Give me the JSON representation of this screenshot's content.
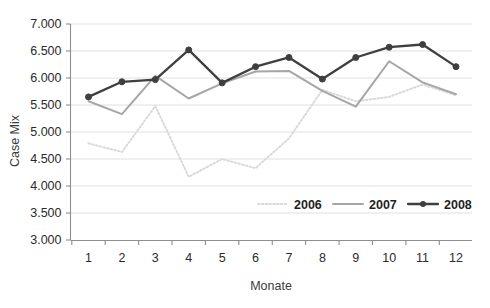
{
  "chart_data": {
    "type": "line",
    "title": "",
    "xlabel": "Monate",
    "ylabel": "Case Mix",
    "categories": [
      "1",
      "2",
      "3",
      "4",
      "5",
      "6",
      "7",
      "8",
      "9",
      "10",
      "11",
      "12"
    ],
    "ylim": [
      3.0,
      7.0
    ],
    "ytick_labels": [
      "3.000",
      "3.500",
      "4.000",
      "4.500",
      "5.000",
      "5.500",
      "6.000",
      "6.500",
      "7.000"
    ],
    "ytick_values": [
      3.0,
      3.5,
      4.0,
      4.5,
      5.0,
      5.5,
      6.0,
      6.5,
      7.0
    ],
    "grid": true,
    "legend_position": "inside-bottom-right",
    "series": [
      {
        "name": "2006",
        "color": "#d9d9d9",
        "style": "dotted",
        "markers": false,
        "values": [
          4.79,
          4.63,
          5.48,
          4.17,
          4.5,
          4.33,
          4.88,
          5.78,
          5.57,
          5.65,
          5.88,
          5.68
        ]
      },
      {
        "name": "2007",
        "color": "#a6a6a6",
        "style": "solid",
        "markers": false,
        "values": [
          5.57,
          5.33,
          6.04,
          5.62,
          5.9,
          6.12,
          6.13,
          5.76,
          5.47,
          6.31,
          5.92,
          5.7
        ]
      },
      {
        "name": "2008",
        "color": "#3f3f3f",
        "style": "solid",
        "markers": true,
        "values": [
          5.65,
          5.93,
          5.97,
          6.52,
          5.91,
          6.21,
          6.38,
          5.98,
          6.38,
          6.57,
          6.62,
          6.21
        ]
      }
    ]
  },
  "legend": {
    "items": [
      {
        "label": "2006"
      },
      {
        "label": "2007"
      },
      {
        "label": "2008"
      }
    ]
  },
  "axes": {
    "y_title": "Case Mix",
    "x_title": "Monate"
  }
}
